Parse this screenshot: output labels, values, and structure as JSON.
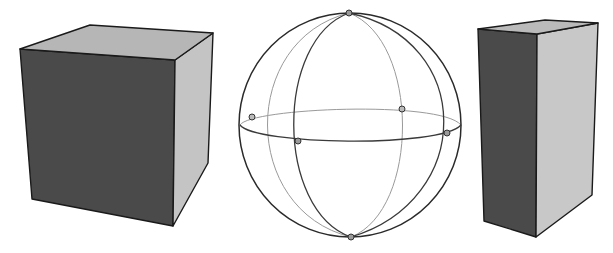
{
  "figure": {
    "colors": {
      "background": "#ffffff",
      "dark_face": "#4a4a4a",
      "light_side": "#c4c4c4",
      "top_face": "#b6b6b6",
      "prism_side": "#c8c8c8",
      "prism_top": "#bababa",
      "edge": "#1a1a1a"
    },
    "shapes": [
      {
        "id": "cube",
        "label": "cube",
        "faces": {
          "front": "20,49 175,60 173,226 32,199",
          "right": "175,60 213,33 208,163 173,226",
          "top": "20,49 90,25 213,33 175,60"
        }
      },
      {
        "id": "sphere",
        "label": "sphere",
        "center": [
          350,
          125
        ],
        "radius_x": 111,
        "radius_y": 112,
        "equator": {
          "cx": 350,
          "cy": 125,
          "rx": 111,
          "ry": 17
        },
        "meridians": [
          {
            "name": "front-left",
            "rx": 52,
            "style": "front"
          },
          {
            "name": "front-right",
            "rx": 97,
            "style": "front"
          },
          {
            "name": "back-left",
            "rx": 97,
            "style": "back"
          },
          {
            "name": "back-right",
            "rx": 52,
            "style": "back"
          }
        ],
        "markers": [
          {
            "name": "north-pole",
            "x": 349,
            "y": 13
          },
          {
            "name": "south-pole",
            "x": 351,
            "y": 237
          },
          {
            "name": "equator-back-left",
            "x": 252,
            "y": 117
          },
          {
            "name": "equator-front-left",
            "x": 298,
            "y": 141
          },
          {
            "name": "equator-back-right",
            "x": 402,
            "y": 109
          },
          {
            "name": "equator-front-right",
            "x": 447,
            "y": 133
          }
        ]
      },
      {
        "id": "prism",
        "label": "rectangular prism",
        "faces": {
          "front": "478,29 537,34 536,237 484,221",
          "right": "537,34 598,23 592,195 536,237",
          "top": "478,29 545,20 598,23 537,34"
        }
      }
    ]
  }
}
